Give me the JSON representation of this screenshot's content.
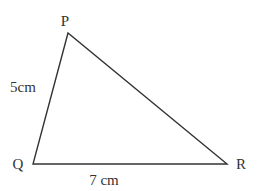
{
  "diagram": {
    "type": "triangle",
    "vertices": {
      "P": {
        "label": "P"
      },
      "Q": {
        "label": "Q"
      },
      "R": {
        "label": "R"
      }
    },
    "sides": {
      "PQ": {
        "label": "5cm"
      },
      "QR": {
        "label": "7 cm"
      }
    },
    "stroke_color": "#333333"
  }
}
